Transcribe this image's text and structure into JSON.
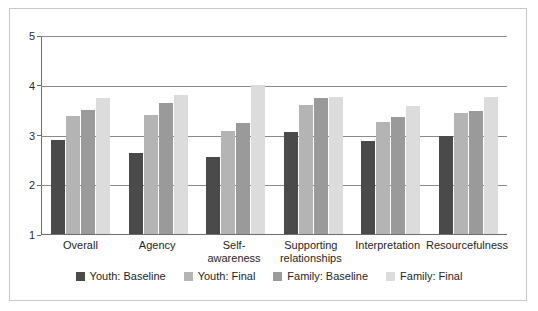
{
  "chart_data": {
    "type": "bar",
    "title": "",
    "xlabel": "",
    "ylabel": "",
    "ylim": [
      1,
      5
    ],
    "yticks": [
      "1",
      "2",
      "3",
      "4",
      "5"
    ],
    "grid": true,
    "legend_position": "bottom",
    "categories": [
      "Overall",
      "Agency",
      "Self-\nawareness",
      "Supporting\nrelationships",
      "Interpretation",
      "Resourcefulness"
    ],
    "series": [
      {
        "name": "Youth: Baseline",
        "color": "#4a4a4a",
        "values": [
          2.88,
          2.63,
          2.55,
          3.05,
          2.87,
          2.98
        ]
      },
      {
        "name": "Youth: Final",
        "color": "#b4b4b4",
        "values": [
          3.38,
          3.4,
          3.08,
          3.6,
          3.25,
          3.43
        ]
      },
      {
        "name": "Family: Baseline",
        "color": "#9a9a9a",
        "values": [
          3.5,
          3.63,
          3.23,
          3.73,
          3.35,
          3.47
        ]
      },
      {
        "name": "Family: Final",
        "color": "#dcdcdc",
        "values": [
          3.73,
          3.8,
          4.0,
          3.75,
          3.57,
          3.75
        ]
      }
    ]
  }
}
